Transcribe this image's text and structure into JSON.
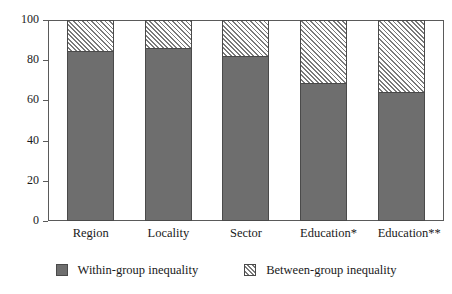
{
  "chart_data": {
    "type": "bar",
    "stacked": true,
    "title": "",
    "subtitle": "",
    "xlabel": "",
    "ylabel": "",
    "ylim": [
      0,
      100
    ],
    "yticks": [
      0,
      20,
      40,
      60,
      80,
      100
    ],
    "ytick_labels": [
      "0",
      "20",
      "40",
      "60",
      "80",
      "100"
    ],
    "grid": false,
    "legend_position": "bottom",
    "categories": [
      "Region",
      "Locality",
      "Sector",
      "Education*",
      "Education**"
    ],
    "series": [
      {
        "name": "Within-group inequality",
        "values": [
          84.5,
          86,
          82,
          68.5,
          64
        ],
        "color": "#6e6e6e",
        "pattern": "solid"
      },
      {
        "name": "Between-group inequality",
        "values": [
          15.5,
          14,
          18,
          31.5,
          36
        ],
        "color": "#ffffff",
        "pattern": "diagonal-hatch"
      }
    ]
  },
  "axis": {
    "frame_color": "#5a5a5a",
    "tick_color": "#5a5a5a"
  },
  "legend": {
    "entries": [
      {
        "label": "Within-group inequality",
        "swatch": "solid-gray-swatch"
      },
      {
        "label": "Between-group inequality",
        "swatch": "hatched-swatch"
      }
    ]
  }
}
